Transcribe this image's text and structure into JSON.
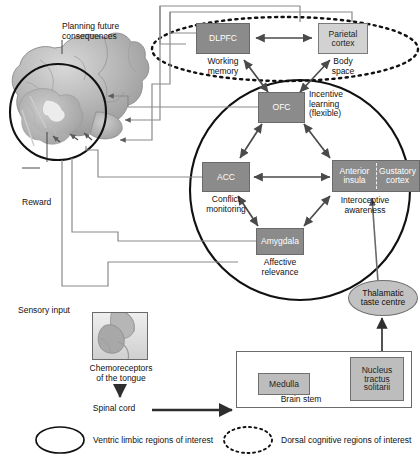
{
  "annotations": {
    "planning": "Planning future\nconsequences",
    "planning_l1": "Planning future",
    "planning_l2": "consequences",
    "reward": "Reward",
    "sensory_input": "Sensory input",
    "chemoreceptors_l1": "Chemoreceptors",
    "chemoreceptors_l2": "of the tongue",
    "spinal_cord": "Spinal cord",
    "brain_stem": "Brain stem"
  },
  "nodes": {
    "dlpfc": {
      "label": "DLPFC",
      "caption_l1": "Working",
      "caption_l2": "memory",
      "fill": "#8b8b8b",
      "style": "dark"
    },
    "parietal": {
      "label_l1": "Parietal",
      "label_l2": "cortex",
      "caption_l1": "Body",
      "caption_l2": "space",
      "fill": "#d2d2d2",
      "style": "light"
    },
    "ofc": {
      "label": "OFC",
      "caption_l1": "Incentive",
      "caption_l2": "learning",
      "caption_l3": "(flexible)",
      "fill": "#8b8b8b",
      "style": "dark"
    },
    "acc": {
      "label": "ACC",
      "caption_l1": "Conflict",
      "caption_l2": "monitoring",
      "fill": "#8b8b8b",
      "style": "dark"
    },
    "insula": {
      "label_l1": "Anterior",
      "label_l2": "insula",
      "fill": "#8b8b8b",
      "style": "dark"
    },
    "gustatory": {
      "label_l1": "Gustatory",
      "label_l2": "cortex",
      "fill": "#8b8b8b",
      "style": "dark"
    },
    "insula_caption_l1": "Interoceptive",
    "insula_caption_l2": "awareness",
    "amygdala": {
      "label": "Amygdala",
      "caption_l1": "Affective",
      "caption_l2": "relevance",
      "fill": "#8b8b8b",
      "style": "dark"
    },
    "thalamic": {
      "label_l1": "Thalamatic",
      "label_l2": "taste centre",
      "fill": "#c2c2c2",
      "style": "ellipse"
    },
    "medulla": {
      "label": "Medulla",
      "fill": "#bdbdbd",
      "style": "mid"
    },
    "nts": {
      "label_l1": "Nucleus",
      "label_l2": "tractus",
      "label_l3": "solitarii",
      "fill": "#bdbdbd",
      "style": "mid"
    }
  },
  "legend": {
    "ventral": {
      "label": "Ventric limbic regions of interest",
      "shape": "solid-ellipse"
    },
    "dorsal": {
      "label": "Dorsal cognitive regions of interest",
      "shape": "dotted-ellipse"
    }
  },
  "colors": {
    "dark_box": "#8b8b8b",
    "light_box": "#d2d2d2",
    "mid_box": "#bdbdbd",
    "line": "#6f6f6f",
    "arrow": "#4a4a4a",
    "text": "#1a1a1a"
  }
}
